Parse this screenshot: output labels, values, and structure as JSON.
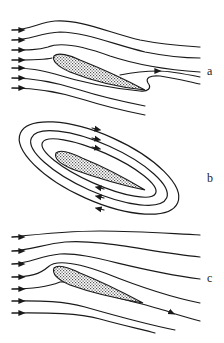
{
  "figure": {
    "panels": [
      {
        "id": "a",
        "label": "a",
        "description": "Potential flow without circulation: streamline wraps around the sharp trailing edge"
      },
      {
        "id": "b",
        "label": "b",
        "description": "Pure circulation: closed circulating streamlines around the airfoil"
      },
      {
        "id": "c",
        "label": "c",
        "description": "Combined flow satisfying the Kutta condition: smooth departure from trailing edge"
      }
    ]
  },
  "colors": {
    "line": "#1a1a1a",
    "airfoil_fill_dot": "#555555",
    "airfoil_fill_bg": "#ffffff",
    "background": "#ffffff"
  }
}
